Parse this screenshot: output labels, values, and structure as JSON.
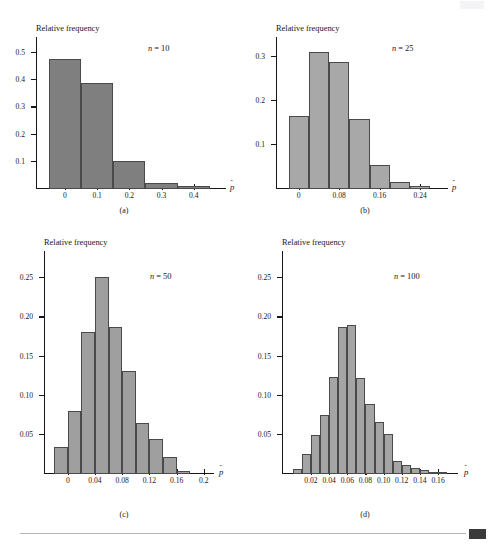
{
  "page": {
    "running_head": "",
    "footer_marker": "page-marker"
  },
  "figure": {
    "y_axis_title": "Relative frequency",
    "x_axis_symbol": "p̂"
  },
  "panels": [
    {
      "id": "a",
      "caption": "(a)",
      "n_prefix": "n",
      "n_eq": "=",
      "n_value": "10",
      "bar_color": "#7f7f7f"
    },
    {
      "id": "b",
      "caption": "(b)",
      "n_prefix": "n",
      "n_eq": "=",
      "n_value": "25",
      "bar_color": "#a8a8a8"
    },
    {
      "id": "c",
      "caption": "(c)",
      "n_prefix": "n",
      "n_eq": "=",
      "n_value": "50",
      "bar_color": "#9f9f9f"
    },
    {
      "id": "d",
      "caption": "(d)",
      "n_prefix": "n",
      "n_eq": "=",
      "n_value": "100",
      "bar_color": "#a5a5a5"
    }
  ],
  "chart_data": [
    {
      "type": "bar",
      "panel": "a",
      "title": "n = 10",
      "xlabel": "p̂",
      "ylabel": "Relative frequency",
      "bin_edges": [
        -0.05,
        0.05,
        0.15,
        0.25,
        0.35,
        0.45
      ],
      "bin_centers": [
        0.0,
        0.1,
        0.2,
        0.3,
        0.4
      ],
      "values": [
        0.48,
        0.39,
        0.105,
        0.022,
        0.01
      ],
      "ytick_values": [
        0.1,
        0.2,
        0.3,
        0.4,
        0.5
      ],
      "ytick_labels": [
        "0.1",
        "0.2",
        "0.3",
        "0.4",
        "0.5"
      ],
      "xtick_values": [
        0.0,
        0.1,
        0.2,
        0.3,
        0.4
      ],
      "xtick_labels": [
        "0",
        "0.1",
        "0.2",
        "0.3",
        "0.4"
      ],
      "xlim": [
        -0.09,
        0.5
      ],
      "ylim": [
        0,
        0.56
      ],
      "grid": false,
      "legend": "none"
    },
    {
      "type": "bar",
      "panel": "b",
      "title": "n = 25",
      "xlabel": "p̂",
      "ylabel": "Relative frequency",
      "bin_edges": [
        -0.02,
        0.02,
        0.06,
        0.1,
        0.14,
        0.18,
        0.22,
        0.26
      ],
      "bin_centers": [
        0.0,
        0.04,
        0.08,
        0.12,
        0.16,
        0.2,
        0.24
      ],
      "values": [
        0.165,
        0.312,
        0.289,
        0.16,
        0.055,
        0.016,
        0.006
      ],
      "ytick_values": [
        0.1,
        0.2,
        0.3
      ],
      "ytick_labels": [
        "0.1",
        "0.2",
        "0.3"
      ],
      "xtick_values": [
        0.0,
        0.08,
        0.16,
        0.24
      ],
      "xtick_labels": [
        "0",
        "0.08",
        "0.16",
        "0.24"
      ],
      "xlim": [
        -0.045,
        0.295
      ],
      "ylim": [
        0,
        0.345
      ],
      "grid": false,
      "legend": "none"
    },
    {
      "type": "bar",
      "panel": "c",
      "title": "n = 50",
      "xlabel": "p̂",
      "ylabel": "Relative frequency",
      "bin_edges": [
        -0.02,
        0.0,
        0.02,
        0.04,
        0.06,
        0.08,
        0.1,
        0.12,
        0.14,
        0.16,
        0.18
      ],
      "bin_centers": [
        -0.01,
        0.01,
        0.03,
        0.05,
        0.07,
        0.09,
        0.11,
        0.13,
        0.15,
        0.17
      ],
      "values": [
        0.035,
        0.08,
        0.182,
        0.252,
        0.188,
        0.132,
        0.065,
        0.045,
        0.022,
        0.004
      ],
      "ytick_values": [
        0.05,
        0.1,
        0.15,
        0.2,
        0.25
      ],
      "ytick_labels": [
        "0.05",
        "0.10",
        "0.15",
        "0.20",
        "0.25"
      ],
      "xtick_values": [
        0.0,
        0.04,
        0.08,
        0.12,
        0.16,
        0.2
      ],
      "xtick_labels": [
        "0",
        "0.04",
        "0.08",
        "0.12",
        "0.16",
        "0.2"
      ],
      "xlim": [
        -0.035,
        0.215
      ],
      "ylim": [
        0,
        0.285
      ],
      "grid": false,
      "legend": "none"
    },
    {
      "type": "bar",
      "panel": "d",
      "title": "n = 100",
      "xlabel": "p̂",
      "ylabel": "Relative frequency",
      "bin_edges": [
        0.0,
        0.01,
        0.02,
        0.03,
        0.04,
        0.05,
        0.06,
        0.07,
        0.08,
        0.09,
        0.1,
        0.11,
        0.12,
        0.13,
        0.14,
        0.15,
        0.16,
        0.17
      ],
      "bin_centers": [
        0.005,
        0.015,
        0.025,
        0.035,
        0.045,
        0.055,
        0.065,
        0.075,
        0.085,
        0.095,
        0.105,
        0.115,
        0.125,
        0.135,
        0.145,
        0.155,
        0.165
      ],
      "values": [
        0.006,
        0.026,
        0.05,
        0.075,
        0.124,
        0.188,
        0.19,
        0.123,
        0.089,
        0.067,
        0.051,
        0.017,
        0.011,
        0.008,
        0.005,
        0.002,
        0.001
      ],
      "ytick_values": [
        0.05,
        0.1,
        0.15,
        0.2,
        0.25
      ],
      "ytick_labels": [
        "0.05",
        "0.10",
        "0.15",
        "0.20",
        "0.25"
      ],
      "xtick_values": [
        0.02,
        0.04,
        0.06,
        0.08,
        0.1,
        0.12,
        0.14,
        0.16
      ],
      "xtick_labels": [
        "0.02",
        "0.04",
        "0.06",
        "0.08",
        "0.10",
        "0.12",
        "0.14",
        "0.16"
      ],
      "xlim": [
        -0.012,
        0.182
      ],
      "ylim": [
        0,
        0.285
      ],
      "grid": false,
      "legend": "none"
    }
  ]
}
